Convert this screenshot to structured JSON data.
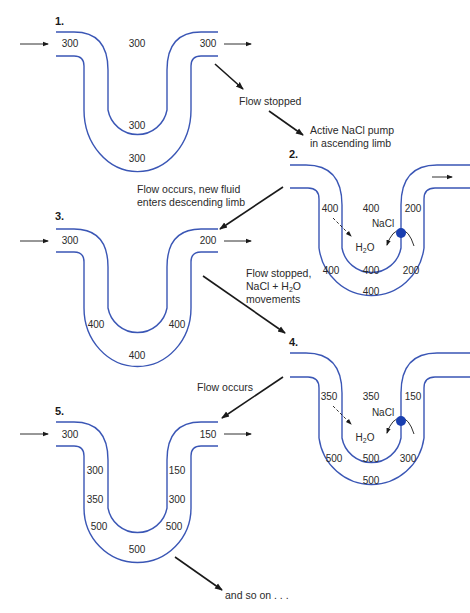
{
  "colors": {
    "tube": "#3a56b5",
    "pump": "#1a3fb0",
    "arrow": "#1a1a1a",
    "text": "#2a2a2a"
  },
  "panels": [
    {
      "id": "1",
      "label": "1.",
      "values": {
        "top_left": "300",
        "top_mid": "300",
        "top_right": "300",
        "inner_bottom": "300",
        "outer_bottom": "300"
      }
    },
    {
      "id": "2",
      "label": "2.",
      "values": {
        "desc_upper": "400",
        "mid_upper": "400",
        "asc_upper": "200",
        "desc_lower": "400",
        "bottom_inner": "400",
        "asc_lower": "200",
        "outer_bottom": "400"
      },
      "pump_label": "NaCl",
      "water_label": "H",
      "water_sub": "2",
      "water_tail": "O"
    },
    {
      "id": "3",
      "label": "3.",
      "values": {
        "inlet": "300",
        "outlet": "200",
        "desc": "400",
        "asc": "400",
        "bottom": "400"
      }
    },
    {
      "id": "4",
      "label": "4.",
      "values": {
        "desc_upper": "350",
        "mid_upper": "350",
        "asc_upper": "150",
        "desc_lower": "500",
        "bottom_inner": "500",
        "asc_lower": "300",
        "outer_bottom": "500"
      },
      "pump_label": "NaCl",
      "water_label": "H",
      "water_sub": "2",
      "water_tail": "O"
    },
    {
      "id": "5",
      "label": "5.",
      "values": {
        "inlet": "300",
        "outlet": "150",
        "desc_1": "300",
        "desc_2": "350",
        "desc_3": "500",
        "asc_1": "150",
        "asc_2": "300",
        "asc_3": "500",
        "bottom": "500"
      }
    }
  ],
  "captions": {
    "flow_stopped": "Flow stopped",
    "pump_line1": "Active NaCl pump",
    "pump_line2": "in ascending limb",
    "new_fluid_line1": "Flow occurs, new fluid",
    "new_fluid_line2": "enters descending limb",
    "stopped_line1": "Flow stopped,",
    "stopped_line2a": "NaCl + H",
    "stopped_line2sub": "2",
    "stopped_line2b": "O",
    "stopped_line3": "movements",
    "flow_occurs": "Flow occurs",
    "and_so_on": "and so on . . ."
  }
}
